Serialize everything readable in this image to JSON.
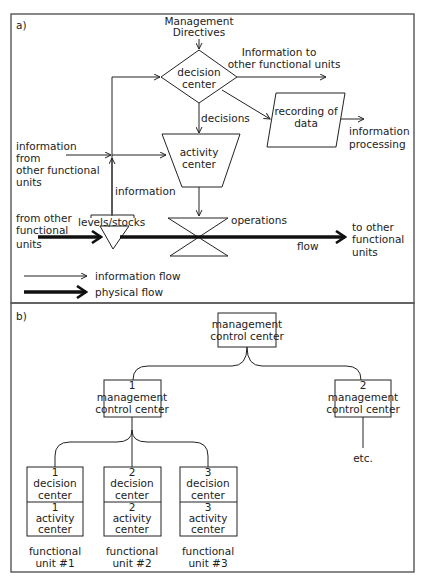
{
  "panel_a": {
    "label": "a)",
    "management_directives": [
      "Management",
      "Directives"
    ],
    "decision_center": [
      "decision",
      "center"
    ],
    "info_to_other_units": [
      "Information to",
      "other functional units"
    ],
    "recording_of_data": [
      "recording of",
      "data"
    ],
    "information_processing": [
      "information",
      "processing"
    ],
    "decisions": "decisions",
    "activity_center": [
      "activity",
      "center"
    ],
    "info_from_other_units": [
      "information",
      "from",
      "other functional",
      "units"
    ],
    "information": "information",
    "levels_stocks": "levels/stocks",
    "operations": "operations",
    "from_other_units": [
      "from other",
      "functional",
      "units"
    ],
    "flow": "flow",
    "to_other_units": [
      "to other",
      "functional",
      "units"
    ],
    "legend": {
      "information_flow": "information flow",
      "physical_flow": "physical flow"
    }
  },
  "panel_b": {
    "label": "b)",
    "top_center": [
      "management",
      "control center"
    ],
    "sub_centers": [
      {
        "num": "1",
        "lines": [
          "management",
          "control center"
        ]
      },
      {
        "num": "2",
        "lines": [
          "management",
          "control center"
        ]
      }
    ],
    "etc": "etc.",
    "units": [
      {
        "dc_num": "1",
        "dc": [
          "decision",
          "center"
        ],
        "ac_num": "1",
        "ac": [
          "activity",
          "center"
        ],
        "label": [
          "functional",
          "unit #1"
        ]
      },
      {
        "dc_num": "2",
        "dc": [
          "decision",
          "center"
        ],
        "ac_num": "2",
        "ac": [
          "activity",
          "center"
        ],
        "label": [
          "functional",
          "unit #2"
        ]
      },
      {
        "dc_num": "3",
        "dc": [
          "decision",
          "center"
        ],
        "ac_num": "3",
        "ac": [
          "activity",
          "center"
        ],
        "label": [
          "functional",
          "unit #3"
        ]
      }
    ]
  },
  "colors": {
    "line": "#222222",
    "frame": "#555555",
    "background": "#ffffff"
  }
}
